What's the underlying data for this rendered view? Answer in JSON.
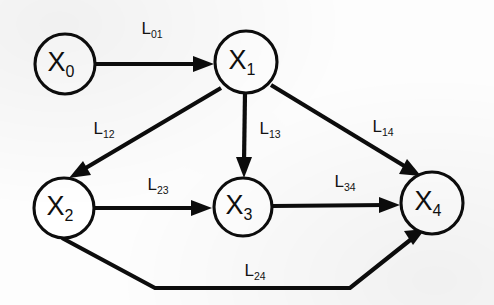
{
  "figure": {
    "background_color": "#fdfdfd",
    "ink_color": "#0d0d0d"
  },
  "nodes": [
    {
      "id": "x0",
      "base": "X",
      "sub": "0",
      "cx": 65,
      "cy": 64,
      "r": 30
    },
    {
      "id": "x1",
      "base": "X",
      "sub": "1",
      "cx": 246,
      "cy": 62,
      "r": 31
    },
    {
      "id": "x2",
      "base": "X",
      "sub": "2",
      "cx": 64,
      "cy": 208,
      "r": 30
    },
    {
      "id": "x3",
      "base": "X",
      "sub": "3",
      "cx": 243,
      "cy": 207,
      "r": 29
    },
    {
      "id": "x4",
      "base": "X",
      "sub": "4",
      "cx": 432,
      "cy": 203,
      "r": 31
    }
  ],
  "edges": [
    {
      "id": "e01",
      "from": "x0",
      "to": "x1",
      "base": "L",
      "sub": "01",
      "label_x": 152,
      "label_y": 30
    },
    {
      "id": "e12",
      "from": "x1",
      "to": "x2",
      "base": "L",
      "sub": "12",
      "label_x": 104,
      "label_y": 130
    },
    {
      "id": "e13",
      "from": "x1",
      "to": "x3",
      "base": "L",
      "sub": "13",
      "label_x": 270,
      "label_y": 130
    },
    {
      "id": "e14",
      "from": "x1",
      "to": "x4",
      "base": "L",
      "sub": "14",
      "label_x": 383,
      "label_y": 128
    },
    {
      "id": "e23",
      "from": "x2",
      "to": "x3",
      "base": "L",
      "sub": "23",
      "label_x": 158,
      "label_y": 186
    },
    {
      "id": "e34",
      "from": "x3",
      "to": "x4",
      "base": "L",
      "sub": "34",
      "label_x": 345,
      "label_y": 183
    },
    {
      "id": "e24",
      "from": "x2",
      "to": "x4",
      "base": "L",
      "sub": "24",
      "label_x": 255,
      "label_y": 272
    }
  ]
}
